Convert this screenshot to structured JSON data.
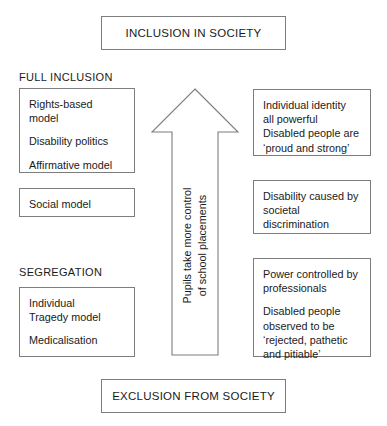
{
  "diagram": {
    "title_top": "INCLUSION IN SOCIETY",
    "title_bottom": "EXCLUSION FROM SOCIETY",
    "labels": {
      "top_section": "FULL INCLUSION",
      "bottom_section": "SEGREGATION"
    },
    "arrow": {
      "name": "upward-arrow",
      "caption_line1": "Pupils take more control",
      "caption_line2": "of school placements",
      "direction": "up",
      "color": "#7d7d7d"
    },
    "left_boxes": [
      {
        "name": "full-inclusion-models-box",
        "paragraphs": [
          "Rights-based\nmodel",
          "Disability politics",
          "Affirmative model"
        ]
      },
      {
        "name": "social-model-box",
        "paragraphs": [
          "Social model"
        ]
      },
      {
        "name": "segregation-models-box",
        "paragraphs": [
          "Individual\nTragedy model",
          "Medicalisation"
        ]
      }
    ],
    "right_boxes": [
      {
        "name": "individual-identity-box",
        "paragraphs": [
          "Individual identity\nall powerful\nDisabled people are\n‘proud and strong’"
        ]
      },
      {
        "name": "societal-discrimination-box",
        "paragraphs": [
          "Disability caused by\nsocietal\ndiscrimination"
        ]
      },
      {
        "name": "professional-power-box",
        "paragraphs": [
          "Power controlled by\nprofessionals",
          "Disabled people\nobserved to be\n‘rejected, pathetic\nand pitiable’"
        ]
      }
    ],
    "colors": {
      "border": "#7d7d7d",
      "text": "#1a1a1a",
      "background": "#ffffff"
    }
  }
}
